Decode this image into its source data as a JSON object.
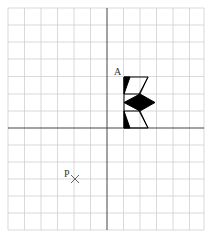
{
  "diagram": {
    "type": "coordinate-grid-transformation",
    "grid": {
      "columns": 12,
      "rows": 13,
      "cell_px": 16.4,
      "line_color": "#cfcfcf",
      "axis_color": "#444444"
    },
    "labels": {
      "vertex_a": "A",
      "point_p": "P"
    },
    "point_p_marker": "×",
    "shape": {
      "description": "Flag-like shape with black triangles and a black diamond, to the right of the y-axis above the x-axis",
      "fill": "#000000",
      "outline": "#000000"
    }
  }
}
